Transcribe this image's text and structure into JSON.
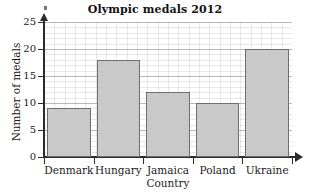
{
  "chart_data": {
    "type": "bar",
    "title": "Olympic medals 2012",
    "xlabel": "Country",
    "ylabel": "Number of medals",
    "categories": [
      "Denmark",
      "Hungary",
      "Jamaica",
      "Poland",
      "Ukraine"
    ],
    "values": [
      9,
      18,
      12,
      10,
      20
    ],
    "ylim": [
      0,
      25
    ],
    "ytick_labels": [
      "0",
      "5",
      "10",
      "15",
      "20",
      "25"
    ],
    "ytick_values": [
      0,
      5,
      10,
      15,
      20,
      25
    ],
    "ytick_step": 5,
    "grid": true,
    "minor_grid": true,
    "legend": null,
    "legend_position": "none",
    "orientation": "vertical",
    "bar_fill_color": "#c9c9c9",
    "bar_border_color": "#6e6e6e",
    "axis_color": "#2b2b2b",
    "grid_color": "#cfc8c8",
    "background_color": "#ffffff",
    "text_color": "#1a1a1a"
  }
}
